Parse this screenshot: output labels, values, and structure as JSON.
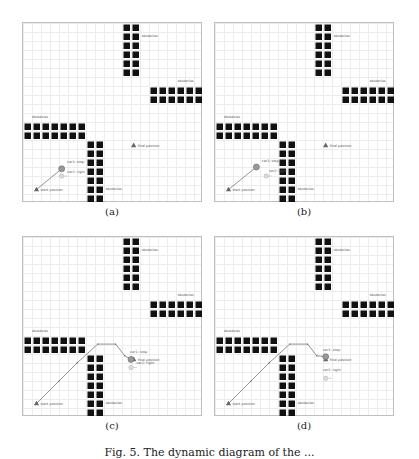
{
  "figure": {
    "caption": "Fig. 5.  The dynamic diagram of the ...",
    "grid": {
      "cols": 20,
      "rows": 20,
      "cell_px": 9
    },
    "obstacle_label": "obstacles",
    "start_label": "start position",
    "final_label": "final position",
    "car1_label": "car1: stop",
    "car2_label": "car2: right",
    "obstacle_blocks": [
      {
        "col": 11,
        "row": 0,
        "w": 2,
        "h": 6,
        "label_col": 13.2,
        "label_row": 1.6
      },
      {
        "col": 14,
        "row": 7,
        "w": 6,
        "h": 2,
        "label_col": 17.2,
        "label_row": 6.5
      },
      {
        "col": 0,
        "row": 11,
        "w": 7,
        "h": 2,
        "label_col": 1.0,
        "label_row": 10.5
      },
      {
        "col": 7,
        "row": 13,
        "w": 2,
        "h": 7,
        "label_col": 9.2,
        "label_row": 18.6
      }
    ],
    "start": {
      "col": 1.5,
      "row": 18.5
    },
    "final": {
      "col": 12.3,
      "row": 13.6
    },
    "panels": [
      {
        "id": "a",
        "label": "(a)",
        "left": 22,
        "top": 22,
        "path": [
          [
            1.5,
            18.5
          ],
          [
            4.3,
            16.2
          ]
        ],
        "car1": {
          "col": 4.3,
          "row": 16.2
        },
        "car2": {
          "col": 4.3,
          "row": 17.0
        },
        "car2_arrow": "right",
        "car1_text_col": 4.9,
        "car1_text_row": 15.6,
        "car2_text_col": 4.9,
        "car2_text_row": 16.7
      },
      {
        "id": "b",
        "label": "(b)",
        "left": 214,
        "top": 22,
        "path": [
          [
            1.5,
            18.5
          ],
          [
            4.6,
            16.0
          ]
        ],
        "car1": {
          "col": 4.6,
          "row": 16.0
        },
        "car2": {
          "col": 5.7,
          "row": 17.0
        },
        "car2_arrow": "right",
        "car1_text_col": 5.2,
        "car1_text_row": 15.4,
        "car2_text_col": 6.0,
        "car2_text_row": 16.6
      },
      {
        "id": "c",
        "label": "(c)",
        "left": 22,
        "top": 236,
        "path": [
          [
            1.5,
            18.5
          ],
          [
            4.0,
            16.0
          ],
          [
            6.0,
            14.0
          ],
          [
            8.3,
            11.9
          ],
          [
            10.3,
            11.9
          ],
          [
            11.3,
            13.2
          ],
          [
            12.0,
            13.6
          ]
        ],
        "car1": {
          "col": 12.0,
          "row": 13.6
        },
        "car2": {
          "col": 12.0,
          "row": 14.5
        },
        "car2_arrow": "right",
        "car1_text_col": 11.9,
        "car1_text_row": 12.9,
        "car2_text_col": 12.6,
        "car2_text_row": 14.1
      },
      {
        "id": "d",
        "label": "(d)",
        "left": 214,
        "top": 236,
        "path": [
          [
            1.5,
            18.5
          ],
          [
            4.0,
            16.0
          ],
          [
            6.0,
            14.0
          ],
          [
            8.3,
            11.9
          ],
          [
            10.3,
            11.9
          ],
          [
            11.3,
            13.2
          ],
          [
            12.3,
            13.3
          ]
        ],
        "car1": {
          "col": 12.3,
          "row": 13.3
        },
        "car2": {
          "col": 12.3,
          "row": 15.7
        },
        "car2_arrow": "right",
        "car1_text_col": 12.0,
        "car1_text_row": 12.7,
        "car2_text_col": 12.0,
        "car2_text_row": 14.9
      }
    ]
  }
}
